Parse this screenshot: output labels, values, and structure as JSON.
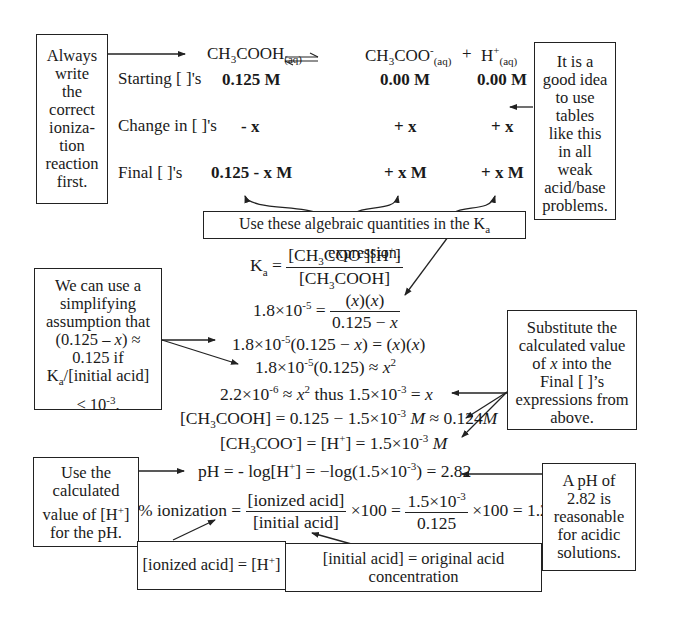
{
  "reaction": {
    "reactant": "CH3COOH(aq)",
    "product1": "CH3COO-(aq)",
    "plus": "+",
    "product2": "H+(aq)",
    "reactant_main": "CH",
    "reactant_sub3": "3",
    "reactant_rest": "COOH",
    "state": "(aq)",
    "product1_main": "CH",
    "product1_sub3": "3",
    "product1_rest": "COO",
    "product1_charge": "-",
    "product2_main": "H",
    "product2_charge": "+"
  },
  "ice_table": {
    "rows": [
      {
        "label": "Starting [ ]'s",
        "values": [
          "0.125 M",
          "0.00 M",
          "0.00 M"
        ]
      },
      {
        "label": "Change in [ ]'s",
        "values": [
          "- x",
          "+ x",
          "+ x"
        ]
      },
      {
        "label": "Final [ ]'s",
        "values": [
          "0.125 - x M",
          "+ x M",
          "+ x M"
        ]
      }
    ]
  },
  "notes": {
    "ionization_first": "Always write the correct ioniza-tion reaction first.",
    "tables_tip": "It is a good idea to use tables like this in all weak acid/base problems.",
    "ka_expression": "Use these algebraic quantities in the Ka expression.",
    "simplifying": "We can use a simplifying assumption that (0.125 − x) ≈ 0.125 if Ka/[initial acid] < 10-3.",
    "substitute": "Substitute the calculated value of x into the Final [ ]'s expressions from above.",
    "use_h": "Use the calculated value of [H+] for the pH.",
    "ph_reasonable": "A pH of 2.82 is reasonable for acidic solutions.",
    "ionized_acid": "[ionized acid] = [H+]",
    "initial_acid": "[initial acid] = original acid concentration"
  },
  "equations": {
    "ka_def": "Ka = [CH3COO-][H+] / [CH3COOH]",
    "step1": "1.8×10-5 = (x)(x) / (0.125 − x)",
    "step2": "1.8×10-5(0.125 − x) = (x)(x)",
    "step3": "1.8×10-5(0.125) ≈ x2",
    "step4": "2.2×10-6 ≈ x2 thus 1.5×10-3 = x",
    "step5": "[CH3COOH] = 0.125 − 1.5×10-3 M ≈ 0.124M",
    "step6": "[CH3COO-] = [H+] = 1.5×10-3 M",
    "step7": "pH = - log[H+] = −log(1.5×10-3) = 2.82",
    "step8": "% ionization = [ionized acid]/[initial acid] × 100 = 1.5×10-3/0.125 × 100 = 1.2%"
  },
  "values": {
    "ka": "1.8",
    "ka_exp": "-5",
    "initial": "0.125",
    "x_sq": "2.2",
    "x_sq_exp": "-6",
    "x": "1.5",
    "x_exp": "-3",
    "final_acid": "0.124",
    "ph": "2.82",
    "percent": "1.2%"
  }
}
